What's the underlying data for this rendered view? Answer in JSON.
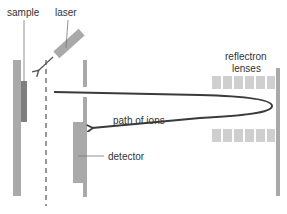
{
  "diagram": {
    "labels": {
      "sample": "sample",
      "laser": "laser",
      "reflectron_line1": "reflectron",
      "reflectron_line2": "lenses",
      "path_of_ions": "path of ions",
      "detector": "detector"
    },
    "colors": {
      "plate": "#a9a9a9",
      "sample_piece": "#7e7e7e",
      "lens": "#cfcfcf",
      "ion_path": "#3a3a3a",
      "text": "#333333",
      "leader": "#777777"
    },
    "components": [
      "sample-plate",
      "sample",
      "laser",
      "laser-beam",
      "dashed-extraction-grid",
      "middle-plate",
      "detector",
      "reflectron-lenses-top (6 blocks)",
      "reflectron-lenses-bottom (6 blocks)",
      "reflectron-back-plate",
      "ion-path (outgoing and returning, with arrowhead)"
    ]
  }
}
